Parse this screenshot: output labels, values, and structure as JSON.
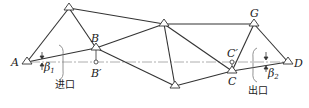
{
  "diagram": {
    "type": "tunnel control triangulation network",
    "points": {
      "A": {
        "label": "A",
        "x": 27,
        "y": 62
      },
      "P1": {
        "label": "",
        "x": 69,
        "y": 8
      },
      "B": {
        "label": "B",
        "x": 96,
        "y": 48
      },
      "Bp": {
        "label": "B′",
        "x": 96,
        "y": 62
      },
      "P2": {
        "label": "",
        "x": 164,
        "y": 24
      },
      "P3": {
        "label": "",
        "x": 175,
        "y": 86
      },
      "C": {
        "label": "C",
        "x": 232,
        "y": 71
      },
      "Cp": {
        "label": "C′",
        "x": 232,
        "y": 62
      },
      "G": {
        "label": "G",
        "x": 254,
        "y": 24
      },
      "D": {
        "label": "D",
        "x": 288,
        "y": 62
      }
    },
    "edges": [
      [
        "A",
        "P1"
      ],
      [
        "A",
        "B"
      ],
      [
        "P1",
        "B"
      ],
      [
        "P1",
        "P2"
      ],
      [
        "B",
        "P2"
      ],
      [
        "B",
        "P3"
      ],
      [
        "P2",
        "P3"
      ],
      [
        "P2",
        "G"
      ],
      [
        "P2",
        "C"
      ],
      [
        "P3",
        "C"
      ],
      [
        "C",
        "G"
      ],
      [
        "C",
        "D"
      ],
      [
        "G",
        "D"
      ]
    ],
    "angles": {
      "beta1": {
        "symbol": "β",
        "sub": "1"
      },
      "beta2": {
        "symbol": "β",
        "sub": "2"
      }
    },
    "labels": {
      "entrance": "进口",
      "exit": "出口",
      "A": "A",
      "B": "B",
      "B_prime": "B′",
      "C": "C",
      "C_prime": "C′",
      "G": "G",
      "D": "D"
    },
    "colors": {
      "line": "#333333",
      "axis": "#999999"
    }
  }
}
